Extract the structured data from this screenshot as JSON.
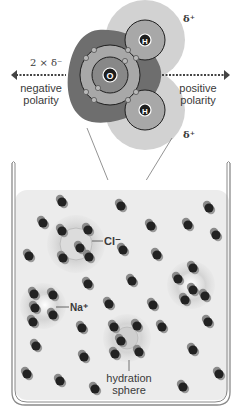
{
  "diagram": {
    "molecule": {
      "oxygen_label": "O",
      "hydrogen_label": "H",
      "delta_plus_top": "δ⁺",
      "delta_plus_bottom": "δ⁺",
      "delta_minus": "2 × δ⁻",
      "left_label_line1": "negative",
      "left_label_line2": "polarity",
      "right_label_line1": "positive",
      "right_label_line2": "polarity"
    },
    "beaker": {
      "chloride_label": "Cl⁻",
      "sodium_label": "Na⁺",
      "hydration_label_line1": "hydration",
      "hydration_label_line2": "sphere"
    },
    "colors": {
      "oxygen_cloud": "#6e6e6e",
      "hydrogen_cloud": "#d2d2d2",
      "shell": "#9a9a9a",
      "nucleus": "#1e1e1e",
      "water": "#ececec",
      "beaker_wall": "#8a8a8a"
    }
  }
}
